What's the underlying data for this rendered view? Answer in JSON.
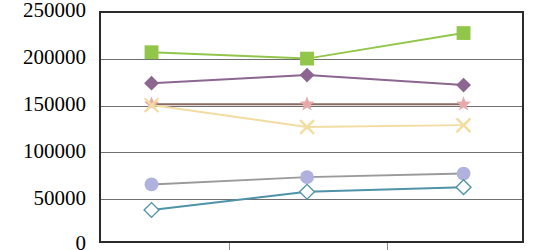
{
  "chart_data": {
    "type": "line",
    "title": "",
    "subtitle": "",
    "xlabel": "",
    "ylabel": "",
    "ylim": [
      0,
      250000
    ],
    "ytick_labels": [
      "250000",
      "200000",
      "150000",
      "100000",
      "50000",
      "0"
    ],
    "ytick_values": [
      250000,
      200000,
      150000,
      100000,
      50000,
      0
    ],
    "grid": true,
    "grid_axis": "y",
    "legend": "none",
    "x": [
      1,
      2,
      3
    ],
    "categories": [
      "",
      "",
      ""
    ],
    "xtick_labels": [
      "",
      "",
      ""
    ],
    "series": [
      {
        "name": "green-square-series",
        "color": "#92c64a",
        "marker": "square",
        "marker_filled": true,
        "values": [
          207000,
          200000,
          228000
        ]
      },
      {
        "name": "purple-diamond-series",
        "color": "#8c6691",
        "marker": "diamond",
        "marker_filled": true,
        "values": [
          173000,
          182000,
          171000
        ]
      },
      {
        "name": "pink-star-series",
        "color": "#e8a9a9",
        "line_color": "#8a6a62",
        "marker": "star",
        "marker_filled": true,
        "values": [
          150000,
          150000,
          150000
        ]
      },
      {
        "name": "yellow-cross-series",
        "color": "#f2dca0",
        "marker": "x",
        "marker_filled": false,
        "values": [
          149000,
          125000,
          127000
        ]
      },
      {
        "name": "periwinkle-circle-series",
        "color": "#b0b2dd",
        "line_color": "#9a9a9a",
        "marker": "circle",
        "marker_filled": true,
        "values": [
          62000,
          70000,
          74000
        ]
      },
      {
        "name": "teal-open-diamond-series",
        "color": "#4f93a8",
        "marker": "diamond",
        "marker_filled": false,
        "values": [
          34000,
          54000,
          59000
        ]
      }
    ]
  },
  "axis": {
    "y_labels": [
      "250000",
      "200000",
      "150000",
      "100000",
      "50000",
      "0"
    ]
  }
}
